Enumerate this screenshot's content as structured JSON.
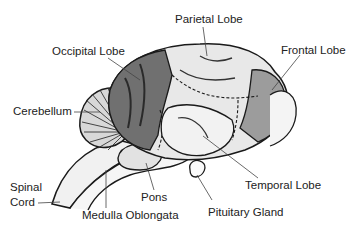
{
  "diagram": {
    "labels": {
      "parietal": "Parietal Lobe",
      "occipital": "Occipital Lobe",
      "frontal": "Frontal Lobe",
      "cerebellum": "Cerebellum",
      "spinal_line1": "Spinal",
      "spinal_line2": "Cord",
      "pons": "Pons",
      "temporal": "Temporal Lobe",
      "medulla": "Medulla Oblongata",
      "pituitary": "Pituitary Gland"
    },
    "colors": {
      "outline": "#1a1a1a",
      "occipital_fill": "#6e6e6e",
      "frontal_fill": "#9a9a9a",
      "lobe_fill": "#e8e8e8",
      "label_text": "#222222"
    }
  }
}
